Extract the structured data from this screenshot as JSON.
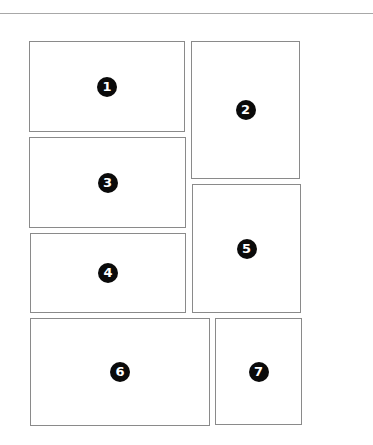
{
  "page": {
    "background": "#ffffff",
    "border_color": "#8a8a8a",
    "badge_color": "#0a0a0a"
  },
  "panels": [
    {
      "label": "1",
      "x": 29,
      "y": 41,
      "w": 156,
      "h": 91
    },
    {
      "label": "2",
      "x": 191,
      "y": 41,
      "w": 109,
      "h": 138
    },
    {
      "label": "3",
      "x": 29,
      "y": 137,
      "w": 157,
      "h": 91
    },
    {
      "label": "4",
      "x": 30,
      "y": 233,
      "w": 156,
      "h": 80
    },
    {
      "label": "5",
      "x": 192,
      "y": 184,
      "w": 109,
      "h": 129
    },
    {
      "label": "6",
      "x": 30,
      "y": 318,
      "w": 180,
      "h": 108
    },
    {
      "label": "7",
      "x": 215,
      "y": 318,
      "w": 87,
      "h": 107
    }
  ]
}
